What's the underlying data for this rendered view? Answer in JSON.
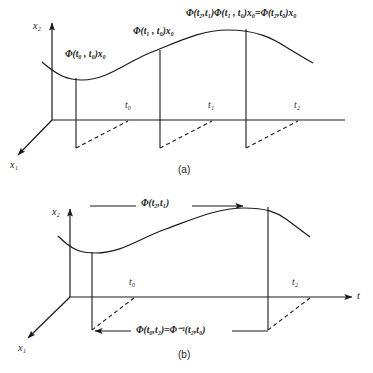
{
  "figure": {
    "background_color": "#ffffff",
    "stroke_color": "#1a1a1a",
    "width": 373,
    "height": 373
  },
  "panel_a": {
    "caption": "(a)",
    "axes": {
      "x2_label": "x₂",
      "x1_label": "x₁",
      "t_axis_label": ""
    },
    "tick_labels": [
      "t₀",
      "t₁",
      "t₂"
    ],
    "annotations": {
      "label_t0": "Φ(t₀ , t₀)x₀",
      "label_t1": "Φ(t₁ , t₀)x₀",
      "label_t2": "Φ(t₂,t₁)Φ(t₁ , t₀)x₀=Φ(t₂,t₀)x₀"
    }
  },
  "panel_b": {
    "caption": "(b)",
    "axes": {
      "x2_label": "x₂",
      "x1_label": "x₁",
      "t_axis_label": "t"
    },
    "tick_labels": [
      "t₀",
      "t₂"
    ],
    "annotations": {
      "forward_label": "Φ(t₂,t₁)",
      "backward_label": "Φ(t₀,t₂)=Φ⁻¹(t₂,t₀)"
    }
  }
}
